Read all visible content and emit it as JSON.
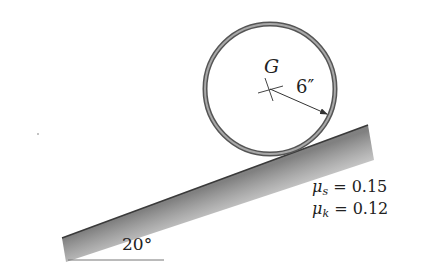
{
  "figure": {
    "type": "statics-diagram"
  },
  "hoop": {
    "center_label": "G",
    "radius_label": "6″",
    "center": [
      270,
      89
    ],
    "radius_px": 66,
    "stroke_color": "#555555",
    "fill_color": "#9a9a9a"
  },
  "incline": {
    "angle_label": "20°",
    "left_end": [
      62,
      238
    ],
    "right_end": [
      368,
      125
    ],
    "shade_color": "#888888"
  },
  "friction": {
    "static": {
      "symbol": "μ",
      "subscript": "s",
      "value_text": " = 0.15"
    },
    "kinetic": {
      "symbol": "μ",
      "subscript": "k",
      "value_text": " = 0.12"
    }
  }
}
